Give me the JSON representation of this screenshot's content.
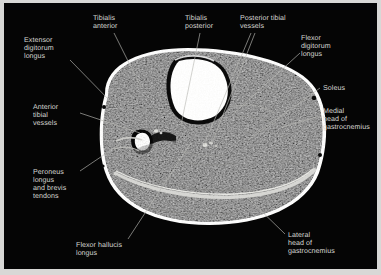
{
  "figure": {
    "type": "annotated-mri-cross-section",
    "modality": "MRI",
    "view": "axial cross-section of lower leg (calf)",
    "panel_background": "#050505",
    "label_color": "#d6d6d2",
    "leader_line_color": "#b9b9b5",
    "page_border_color": "#d8d8d6"
  },
  "labels": [
    {
      "id": "extensor-digitorum-longus",
      "text": "Extensor\ndigitorum\nlongus",
      "x": 20,
      "y": 33,
      "align": "left"
    },
    {
      "id": "tibialis-anterior",
      "text": "Tibialis\nanterior",
      "x": 89,
      "y": 11,
      "align": "left"
    },
    {
      "id": "tibialis-posterior",
      "text": "Tibialis\nposterior",
      "x": 181,
      "y": 11,
      "align": "left"
    },
    {
      "id": "posterior-tibial-vessels",
      "text": "Posterior tibial\nvessels",
      "x": 236,
      "y": 11,
      "align": "left"
    },
    {
      "id": "flexor-digitorum-longus",
      "text": "Flexor\ndigitorum\nlongus",
      "x": 297,
      "y": 31,
      "align": "left"
    },
    {
      "id": "soleus",
      "text": "Soleus",
      "x": 319,
      "y": 81,
      "align": "left"
    },
    {
      "id": "medial-head-of-gastrocnemius",
      "text": "Medial\nhead of\ngastrocnemius",
      "x": 319,
      "y": 104,
      "align": "left"
    },
    {
      "id": "anterior-tibial-vessels",
      "text": "Anterior\ntibial\nvessels",
      "x": 29,
      "y": 100,
      "align": "left"
    },
    {
      "id": "peroneus-longus-and-brevis-tendons",
      "text": "Peroneus\nlongus\nand brevis\ntendons",
      "x": 29,
      "y": 165,
      "align": "left"
    },
    {
      "id": "flexor-hallucis-longus",
      "text": "Flexor hallucis\nlongus",
      "x": 72,
      "y": 238,
      "align": "left"
    },
    {
      "id": "lateral-head-of-gastrocnemius",
      "text": "Lateral\nhead of\ngastrocnemius",
      "x": 284,
      "y": 228,
      "align": "left"
    }
  ],
  "leader_lines": [
    {
      "id": "leader-extensor-digitorum-longus",
      "from": [
        66,
        57
      ],
      "to": [
        108,
        100
      ]
    },
    {
      "id": "leader-tibialis-anterior",
      "from": [
        110,
        30
      ],
      "to": [
        137,
        84
      ]
    },
    {
      "id": "leader-tibialis-posterior",
      "from": [
        196,
        30
      ],
      "to": [
        177,
        122
      ]
    },
    {
      "id": "leader-posterior-tibial-vessels-a",
      "from": [
        247,
        30
      ],
      "to": [
        200,
        142
      ]
    },
    {
      "id": "leader-posterior-tibial-vessels-b",
      "from": [
        251,
        30
      ],
      "to": [
        208,
        140
      ]
    },
    {
      "id": "leader-flexor-digitorum-longus",
      "from": [
        296,
        50
      ],
      "to": [
        228,
        112
      ]
    },
    {
      "id": "leader-soleus",
      "from": [
        316,
        85
      ],
      "to": [
        244,
        137
      ]
    },
    {
      "id": "leader-medial-head-of-gastrocnemius",
      "from": [
        316,
        113
      ],
      "to": [
        278,
        124
      ]
    },
    {
      "id": "leader-anterior-tibial-vessels",
      "from": [
        76,
        110
      ],
      "to": [
        136,
        130
      ]
    },
    {
      "id": "leader-peroneus-longus-brevis",
      "from": [
        76,
        168
      ],
      "to": [
        116,
        141
      ]
    },
    {
      "id": "leader-flexor-hallucis-longus",
      "from": [
        124,
        236
      ],
      "to": [
        187,
        140
      ]
    },
    {
      "id": "leader-lateral-head-of-gastrocnemius",
      "from": [
        281,
        231
      ],
      "to": [
        245,
        196
      ]
    }
  ],
  "anatomy": {
    "bone_tibia": "bright marrow signal, anterior-medial, with dark cortical rim",
    "bone_fibula": "small dark cortical ring, lateral",
    "subcutaneous_fat": "bright rim around entire circumference",
    "skin_markers": 3
  }
}
